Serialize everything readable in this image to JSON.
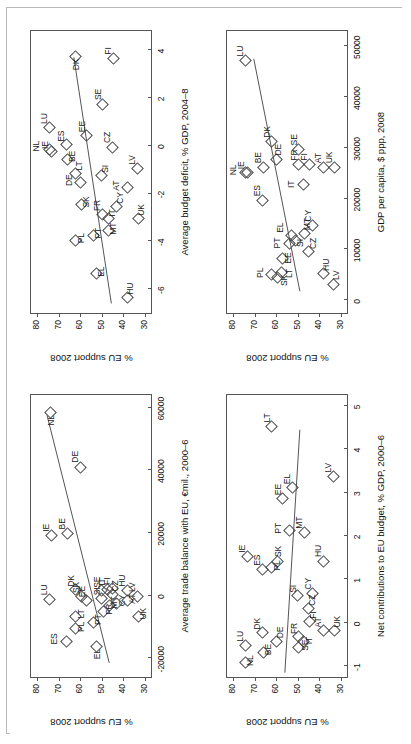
{
  "figure": {
    "marker": "open-diamond",
    "panel_count": 4,
    "line_color": "#555555",
    "text_color": "#111111"
  },
  "chart_data": [
    {
      "type": "scatter",
      "title": "",
      "xlabel": "Average trade balance with EU, €mil., 2000–6",
      "ylabel": "% EU support 2008",
      "xlim": [
        -26000,
        64000
      ],
      "ylim": [
        27,
        83
      ],
      "xticks": [
        -20000,
        0,
        20000,
        40000,
        60000
      ],
      "xticklabels": [
        "-20000",
        "0",
        "20000",
        "40000",
        "60000"
      ],
      "yticks": [
        30,
        40,
        50,
        60,
        70,
        80
      ],
      "yticklabels": [
        "30",
        "40",
        "50",
        "60",
        "70",
        "80"
      ],
      "grid": false,
      "legend": false,
      "fit_line": {
        "x1": -21500,
        "y1": 46.5,
        "x2": 57500,
        "y2": 75.5
      },
      "points": [
        {
          "label": "NL",
          "x": 58000,
          "y": 74.5,
          "lab_dx": -12,
          "lab_dy": 3
        },
        {
          "label": "DE",
          "x": 40500,
          "y": 60.5,
          "lab_dx": 6,
          "lab_dy": -3
        },
        {
          "label": "IE",
          "x": 18800,
          "y": 74.0,
          "lab_dx": 5,
          "lab_dy": -3
        },
        {
          "label": "BE",
          "x": 19500,
          "y": 66.5,
          "lab_dx": 5,
          "lab_dy": -3
        },
        {
          "label": "LU",
          "x": -1500,
          "y": 75.0,
          "lab_dx": 5,
          "lab_dy": -3
        },
        {
          "label": "ES",
          "x": -15000,
          "y": 67.0,
          "lab_dx": -2,
          "lab_dy": -10
        },
        {
          "label": "DK",
          "x": 1500,
          "y": 62.5,
          "lab_dx": 4,
          "lab_dy": -3
        },
        {
          "label": "PL",
          "x": -11000,
          "y": 62.5,
          "lab_dx": -2,
          "lab_dy": 7
        },
        {
          "label": "LT",
          "x": -7000,
          "y": 62.5,
          "lab_dx": -1,
          "lab_dy": 7
        },
        {
          "label": "SK",
          "x": -500,
          "y": 60.0,
          "lab_dx": 4,
          "lab_dy": -3
        },
        {
          "label": "EE",
          "x": -1800,
          "y": 57.5,
          "lab_dx": 4,
          "lab_dy": -3
        },
        {
          "label": "PT",
          "x": -8800,
          "y": 54.5,
          "lab_dx": -2,
          "lab_dy": 7
        },
        {
          "label": "EL",
          "x": -16500,
          "y": 53.0,
          "lab_dx": -12,
          "lab_dy": 3
        },
        {
          "label": "SI",
          "x": -1200,
          "y": 50.5,
          "lab_dx": 4,
          "lab_dy": -3
        },
        {
          "label": "SE",
          "x": 1200,
          "y": 50.5,
          "lab_dx": 4,
          "lab_dy": -3
        },
        {
          "label": "FR",
          "x": -5500,
          "y": 49.5,
          "lab_dx": -2,
          "lab_dy": 7
        },
        {
          "label": "IT",
          "x": 1500,
          "y": 48.0,
          "lab_dx": 5,
          "lab_dy": -3
        },
        {
          "label": "MT",
          "x": -3500,
          "y": 47.0,
          "lab_dx": -2,
          "lab_dy": 7
        },
        {
          "label": "CZ",
          "x": 0,
          "y": 45.5,
          "lab_dx": 4,
          "lab_dy": 5
        },
        {
          "label": "FI",
          "x": 1800,
          "y": 45.5,
          "lab_dx": 5,
          "lab_dy": -3
        },
        {
          "label": "CY",
          "x": -2800,
          "y": 43.5,
          "lab_dx": -2,
          "lab_dy": 7
        },
        {
          "label": "AT",
          "x": -2000,
          "y": 38.5,
          "lab_dx": -2,
          "lab_dy": 7
        },
        {
          "label": "HU",
          "x": 1200,
          "y": 38.5,
          "lab_dx": 5,
          "lab_dy": -3
        },
        {
          "label": "LV",
          "x": -500,
          "y": 34.0,
          "lab_dx": 5,
          "lab_dy": -3
        },
        {
          "label": "UK",
          "x": -7000,
          "y": 33.5,
          "lab_dx": -2,
          "lab_dy": 7
        }
      ]
    },
    {
      "type": "scatter",
      "title": "",
      "xlabel": "Average budget deficit, % GDP, 2004–8",
      "ylabel": "% EU support 2008",
      "xlim": [
        -7.0,
        4.8
      ],
      "ylim": [
        27,
        83
      ],
      "xticks": [
        -6,
        -4,
        -2,
        0,
        2,
        4
      ],
      "xticklabels": [
        "-6",
        "-4",
        "-2",
        "0",
        "2",
        "4"
      ],
      "yticks": [
        30,
        40,
        50,
        60,
        70,
        80
      ],
      "yticklabels": [
        "30",
        "40",
        "50",
        "60",
        "70",
        "80"
      ],
      "grid": false,
      "legend": false,
      "fit_line": {
        "x1": -6.6,
        "y1": 45.5,
        "x2": 3.7,
        "y2": 63.0
      },
      "points": [
        {
          "label": "DK",
          "x": 3.7,
          "y": 62.5,
          "lab_dx": -13,
          "lab_dy": 2
        },
        {
          "label": "FI",
          "x": 3.6,
          "y": 45.0,
          "lab_dx": 5,
          "lab_dy": -3
        },
        {
          "label": "SE",
          "x": 1.7,
          "y": 50.0,
          "lab_dx": 5,
          "lab_dy": -3
        },
        {
          "label": "LU",
          "x": 0.7,
          "y": 75.0,
          "lab_dx": 5,
          "lab_dy": -3
        },
        {
          "label": "EE",
          "x": 0.4,
          "y": 57.5,
          "lab_dx": 4,
          "lab_dy": -3
        },
        {
          "label": "NL",
          "x": -0.2,
          "y": 75.0,
          "lab_dx": -1,
          "lab_dy": -11
        },
        {
          "label": "IE",
          "x": -0.3,
          "y": 73.8,
          "lab_dx": 4,
          "lab_dy": -5
        },
        {
          "label": "ES",
          "x": 0.0,
          "y": 67.0,
          "lab_dx": 4,
          "lab_dy": -3
        },
        {
          "label": "BE",
          "x": -0.6,
          "y": 66.5,
          "lab_dx": -2,
          "lab_dy": 7
        },
        {
          "label": "CZ",
          "x": -0.1,
          "y": 45.5,
          "lab_dx": 5,
          "lab_dy": -3
        },
        {
          "label": "DE",
          "x": -1.6,
          "y": 60.5,
          "lab_dx": -2,
          "lab_dy": -9
        },
        {
          "label": "LT",
          "x": -1.2,
          "y": 62.5,
          "lab_dx": 4,
          "lab_dy": 5
        },
        {
          "label": "SI",
          "x": -1.3,
          "y": 50.5,
          "lab_dx": 4,
          "lab_dy": 5
        },
        {
          "label": "SK",
          "x": -2.5,
          "y": 60.0,
          "lab_dx": -2,
          "lab_dy": 7
        },
        {
          "label": "AT",
          "x": -1.8,
          "y": 38.5,
          "lab_dx": -2,
          "lab_dy": -9
        },
        {
          "label": "LV",
          "x": -1.0,
          "y": 34.0,
          "lab_dx": 5,
          "lab_dy": -3
        },
        {
          "label": "CY",
          "x": -2.6,
          "y": 43.5,
          "lab_dx": 4,
          "lab_dy": 5
        },
        {
          "label": "PL",
          "x": -4.0,
          "y": 62.5,
          "lab_dx": -2,
          "lab_dy": 7
        },
        {
          "label": "PT",
          "x": -3.8,
          "y": 54.5,
          "lab_dx": -2,
          "lab_dy": 7
        },
        {
          "label": "FR",
          "x": -2.9,
          "y": 50.0,
          "lab_dx": 4,
          "lab_dy": -4
        },
        {
          "label": "MT",
          "x": -3.6,
          "y": 47.5,
          "lab_dx": -3,
          "lab_dy": 7
        },
        {
          "label": "IT",
          "x": -3.1,
          "y": 47.5,
          "lab_dx": 3,
          "lab_dy": 6
        },
        {
          "label": "UK",
          "x": -3.1,
          "y": 33.5,
          "lab_dx": 4,
          "lab_dy": 5
        },
        {
          "label": "EL",
          "x": -5.4,
          "y": 53.0,
          "lab_dx": -2,
          "lab_dy": 7
        },
        {
          "label": "HU",
          "x": -6.4,
          "y": 38.5,
          "lab_dx": 4,
          "lab_dy": 5
        }
      ]
    },
    {
      "type": "scatter",
      "title": "",
      "xlabel": "Net contributions to EU budget, % GDP, 2000–6",
      "ylabel": "% EU support 2008",
      "xlim": [
        -1.25,
        5.25
      ],
      "ylim": [
        27,
        83
      ],
      "xticks": [
        -1,
        0,
        1,
        2,
        3,
        4,
        5
      ],
      "xticklabels": [
        "-1",
        "0",
        "1",
        "2",
        "3",
        "4",
        "5"
      ],
      "yticks": [
        30,
        40,
        50,
        60,
        70,
        80
      ],
      "yticklabels": [
        "30",
        "40",
        "50",
        "60",
        "70",
        "80"
      ],
      "grid": false,
      "legend": false,
      "fit_line": {
        "x1": -1.15,
        "y1": 56.0,
        "x2": 4.45,
        "y2": 49.0
      },
      "points": [
        {
          "label": "LT",
          "x": 4.5,
          "y": 62.5,
          "lab_dx": 5,
          "lab_dy": -3
        },
        {
          "label": "LV",
          "x": 3.35,
          "y": 34.0,
          "lab_dx": 5,
          "lab_dy": -3
        },
        {
          "label": "EL",
          "x": 3.1,
          "y": 53.0,
          "lab_dx": 4,
          "lab_dy": -3
        },
        {
          "label": "EE",
          "x": 2.85,
          "y": 57.5,
          "lab_dx": 4,
          "lab_dy": -3
        },
        {
          "label": "PT",
          "x": 2.1,
          "y": 54.5,
          "lab_dx": -2,
          "lab_dy": -9
        },
        {
          "label": "MT",
          "x": 2.05,
          "y": 47.5,
          "lab_dx": 5,
          "lab_dy": -3
        },
        {
          "label": "IE",
          "x": 1.5,
          "y": 74.0,
          "lab_dx": 5,
          "lab_dy": -3
        },
        {
          "label": "ES",
          "x": 1.2,
          "y": 67.0,
          "lab_dx": 5,
          "lab_dy": -3
        },
        {
          "label": "SK",
          "x": 1.4,
          "y": 60.0,
          "lab_dx": 5,
          "lab_dy": 3
        },
        {
          "label": "PL",
          "x": 1.25,
          "y": 62.5,
          "lab_dx": -2,
          "lab_dy": 7
        },
        {
          "label": "HU",
          "x": 1.4,
          "y": 38.5,
          "lab_dx": 5,
          "lab_dy": -3
        },
        {
          "label": "SI",
          "x": 0.6,
          "y": 50.5,
          "lab_dx": 4,
          "lab_dy": -3
        },
        {
          "label": "CY",
          "x": 0.65,
          "y": 43.5,
          "lab_dx": 5,
          "lab_dy": -3
        },
        {
          "label": "CZ",
          "x": 0.3,
          "y": 45.5,
          "lab_dx": 4,
          "lab_dy": 6
        },
        {
          "label": "FI",
          "x": 0.0,
          "y": 45.0,
          "lab_dx": 4,
          "lab_dy": 6
        },
        {
          "label": "LU",
          "x": -0.55,
          "y": 75.0,
          "lab_dx": 5,
          "lab_dy": -3
        },
        {
          "label": "NL",
          "x": -0.95,
          "y": 75.0,
          "lab_dx": -2,
          "lab_dy": 7
        },
        {
          "label": "DK",
          "x": -0.25,
          "y": 67.0,
          "lab_dx": 4,
          "lab_dy": -3
        },
        {
          "label": "BE",
          "x": -0.7,
          "y": 66.5,
          "lab_dx": -2,
          "lab_dy": 7
        },
        {
          "label": "DE",
          "x": -0.45,
          "y": 60.5,
          "lab_dx": 4,
          "lab_dy": 6
        },
        {
          "label": "FR",
          "x": -0.35,
          "y": 50.0,
          "lab_dx": 4,
          "lab_dy": -3
        },
        {
          "label": "SE",
          "x": -0.6,
          "y": 50.0,
          "lab_dx": -2,
          "lab_dy": 8
        },
        {
          "label": "IT",
          "x": -0.45,
          "y": 48.0,
          "lab_dx": -2,
          "lab_dy": 8
        },
        {
          "label": "AT",
          "x": -0.2,
          "y": 38.5,
          "lab_dx": 4,
          "lab_dy": -3
        },
        {
          "label": "UK",
          "x": -0.2,
          "y": 33.5,
          "lab_dx": 4,
          "lab_dy": 5
        }
      ]
    },
    {
      "type": "scatter",
      "title": "",
      "xlabel": "GDP per capita, $ ppp, 2008",
      "ylabel": "% EU support 2008",
      "xlim": [
        -2500,
        53000
      ],
      "ylim": [
        27,
        83
      ],
      "xticks": [
        0,
        10000,
        20000,
        30000,
        40000,
        50000
      ],
      "xticklabels": [
        "0",
        "10000",
        "20000",
        "30000",
        "40000",
        "50000"
      ],
      "yticks": [
        30,
        40,
        50,
        60,
        70,
        80
      ],
      "yticklabels": [
        "30",
        "40",
        "50",
        "60",
        "70",
        "80"
      ],
      "grid": false,
      "legend": false,
      "fit_line": {
        "x1": 1800,
        "y1": 49.0,
        "x2": 47500,
        "y2": 70.5
      },
      "points": [
        {
          "label": "LU",
          "x": 47000,
          "y": 75.0,
          "lab_dx": 5,
          "lab_dy": -3
        },
        {
          "label": "DK",
          "x": 31000,
          "y": 62.5,
          "lab_dx": 5,
          "lab_dy": -3
        },
        {
          "label": "NL",
          "x": 25000,
          "y": 75.0,
          "lab_dx": -2,
          "lab_dy": -10
        },
        {
          "label": "IE",
          "x": 25000,
          "y": 73.8,
          "lab_dx": 4,
          "lab_dy": -5
        },
        {
          "label": "BE",
          "x": 26000,
          "y": 66.5,
          "lab_dx": 5,
          "lab_dy": -3
        },
        {
          "label": "DE",
          "x": 27500,
          "y": 60.5,
          "lab_dx": 5,
          "lab_dy": 4
        },
        {
          "label": "ES",
          "x": 19500,
          "y": 67.0,
          "lab_dx": 5,
          "lab_dy": -3
        },
        {
          "label": "FR",
          "x": 26500,
          "y": 50.0,
          "lab_dx": 5,
          "lab_dy": -3
        },
        {
          "label": "SE",
          "x": 29500,
          "y": 50.0,
          "lab_dx": 5,
          "lab_dy": -3
        },
        {
          "label": "IT",
          "x": 22500,
          "y": 48.0,
          "lab_dx": -2,
          "lab_dy": -10
        },
        {
          "label": "FI",
          "x": 26500,
          "y": 45.0,
          "lab_dx": 5,
          "lab_dy": -3
        },
        {
          "label": "AT",
          "x": 26000,
          "y": 38.5,
          "lab_dx": 5,
          "lab_dy": -3
        },
        {
          "label": "UK",
          "x": 26000,
          "y": 33.5,
          "lab_dx": 5,
          "lab_dy": -3
        },
        {
          "label": "CY",
          "x": 14500,
          "y": 43.5,
          "lab_dx": 5,
          "lab_dy": -3
        },
        {
          "label": "PT",
          "x": 11000,
          "y": 54.5,
          "lab_dx": -4,
          "lab_dy": -10
        },
        {
          "label": "EL",
          "x": 12500,
          "y": 53.5,
          "lab_dx": 4,
          "lab_dy": -9
        },
        {
          "label": "SI",
          "x": 11500,
          "y": 51.5,
          "lab_dx": -5,
          "lab_dy": 6
        },
        {
          "label": "MT",
          "x": 13000,
          "y": 47.5,
          "lab_dx": 4,
          "lab_dy": 5
        },
        {
          "label": "CZ",
          "x": 9500,
          "y": 45.5,
          "lab_dx": 3,
          "lab_dy": 7
        },
        {
          "label": "EE",
          "x": 8000,
          "y": 57.5,
          "lab_dx": -4,
          "lab_dy": 7
        },
        {
          "label": "PL",
          "x": 4800,
          "y": 62.5,
          "lab_dx": -2,
          "lab_dy": -10
        },
        {
          "label": "SK",
          "x": 4200,
          "y": 60.0,
          "lab_dx": -7,
          "lab_dy": 9
        },
        {
          "label": "LT",
          "x": 5200,
          "y": 58.0,
          "lab_dx": -4,
          "lab_dy": 9
        },
        {
          "label": "HU",
          "x": 5000,
          "y": 38.5,
          "lab_dx": 4,
          "lab_dy": 5
        },
        {
          "label": "LV",
          "x": 3000,
          "y": 34.0,
          "lab_dx": 5,
          "lab_dy": 5
        }
      ]
    }
  ]
}
